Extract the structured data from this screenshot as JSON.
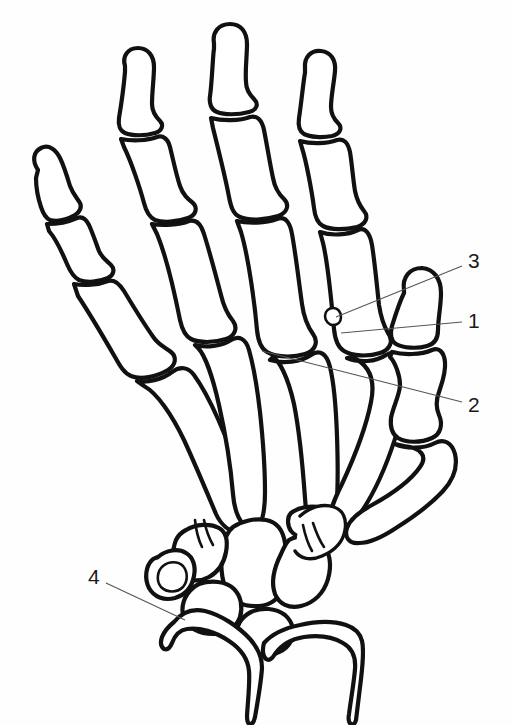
{
  "figure": {
    "background_color": "#fefefe",
    "line_color": "#111111",
    "leader_color": "#555555",
    "label_color": "#1a1a1a"
  },
  "labels": [
    {
      "id": "label-3",
      "text": "3",
      "x": 472,
      "y": 262,
      "leader": {
        "x1": 462,
        "y1": 266,
        "x2": 336,
        "y2": 317
      }
    },
    {
      "id": "label-1",
      "text": "1",
      "x": 472,
      "y": 322,
      "leader": {
        "x1": 462,
        "y1": 322,
        "x2": 341,
        "y2": 333
      }
    },
    {
      "id": "label-2",
      "text": "2",
      "x": 472,
      "y": 406,
      "leader": {
        "x1": 462,
        "y1": 402,
        "x2": 262,
        "y2": 351
      }
    },
    {
      "id": "label-4",
      "text": "4",
      "x": 95,
      "y": 578,
      "leader": {
        "x1": 106,
        "y1": 583,
        "x2": 185,
        "y2": 620
      }
    }
  ],
  "bone_groups": [
    {
      "name": "little-finger",
      "bones": [
        "distal-phalanx",
        "middle-phalanx",
        "proximal-phalanx",
        "fifth-metacarpal"
      ]
    },
    {
      "name": "ring-finger",
      "bones": [
        "distal-phalanx",
        "middle-phalanx",
        "proximal-phalanx",
        "fourth-metacarpal"
      ]
    },
    {
      "name": "middle-finger",
      "bones": [
        "distal-phalanx",
        "middle-phalanx",
        "proximal-phalanx",
        "third-metacarpal"
      ]
    },
    {
      "name": "index-finger",
      "bones": [
        "distal-phalanx",
        "middle-phalanx",
        "proximal-phalanx",
        "second-metacarpal"
      ]
    },
    {
      "name": "thumb",
      "bones": [
        "distal-phalanx",
        "proximal-phalanx",
        "first-metacarpal",
        "sesamoid"
      ]
    },
    {
      "name": "carpus",
      "bones": [
        "scaphoid",
        "lunate",
        "triquetrum",
        "pisiform",
        "trapezium",
        "trapezoid",
        "capitate",
        "hamate"
      ]
    },
    {
      "name": "forearm",
      "bones": [
        "radius",
        "ulna"
      ]
    }
  ]
}
